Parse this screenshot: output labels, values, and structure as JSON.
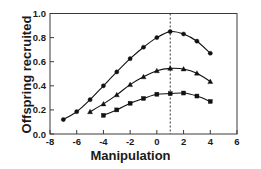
{
  "chart_data": {
    "type": "line",
    "title": "",
    "xlabel": "Manipulation",
    "ylabel": "Offspring recruited",
    "xlim": [
      -8,
      6
    ],
    "ylim": [
      0.0,
      1.0
    ],
    "xticks": [
      -8,
      -6,
      -4,
      -2,
      0,
      2,
      4,
      6
    ],
    "xticklabels": [
      "-8",
      "-6",
      "-4",
      "-2",
      "0",
      "2",
      "4",
      "6"
    ],
    "yticks": [
      0.0,
      0.2,
      0.4,
      0.6,
      0.8,
      1.0
    ],
    "yticklabels": [
      "0.0",
      "0.2",
      "0.4",
      "0.6",
      "0.8",
      "1.0"
    ],
    "grid": false,
    "legend": "none",
    "annotations": [
      {
        "type": "vertical-dashed-line",
        "x": 1,
        "label": "optimum-reference-line"
      }
    ],
    "series": [
      {
        "name": "upper-curve",
        "marker": "circle",
        "color": "#111111",
        "x": [
          -7,
          -6,
          -5,
          -4,
          -3,
          -2,
          -1,
          0,
          1,
          2,
          3,
          4
        ],
        "y": [
          0.12,
          0.185,
          0.285,
          0.4,
          0.515,
          0.625,
          0.72,
          0.8,
          0.85,
          0.83,
          0.77,
          0.67
        ]
      },
      {
        "name": "middle-curve",
        "marker": "triangle",
        "color": "#111111",
        "x": [
          -5,
          -4,
          -3,
          -2,
          -1,
          0,
          1,
          2,
          3,
          4
        ],
        "y": [
          0.185,
          0.25,
          0.325,
          0.41,
          0.475,
          0.525,
          0.545,
          0.54,
          0.505,
          0.435
        ]
      },
      {
        "name": "lower-curve",
        "marker": "square",
        "color": "#111111",
        "x": [
          -4,
          -3,
          -2,
          -1,
          0,
          1,
          2,
          3,
          4
        ],
        "y": [
          0.155,
          0.2,
          0.255,
          0.295,
          0.33,
          0.335,
          0.34,
          0.315,
          0.27
        ]
      }
    ]
  }
}
